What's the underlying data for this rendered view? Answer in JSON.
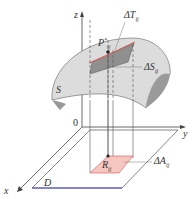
{
  "diagram": {
    "labels": {
      "z_axis": "z",
      "y_axis": "y",
      "x_axis": "x",
      "origin": "0",
      "surface": "S",
      "region": "D",
      "tangent_patch": "ΔT",
      "tangent_patch_sub": "ij",
      "surface_patch": "ΔS",
      "surface_patch_sub": "ij",
      "point": "P",
      "point_sub": "ij",
      "point_sup": "*",
      "rect": "R",
      "rect_sub": "ij",
      "area": "ΔA",
      "area_sub": "ij"
    },
    "colors": {
      "surface_fill": "#d9d9d9",
      "surface_dark": "#8c8c8c",
      "tangent_fill": "#f2b8b0",
      "tangent_stroke": "#d9534f",
      "rect_fill": "#f6c6c0",
      "region_edge": "#4a4ad6",
      "line": "#444444"
    }
  }
}
